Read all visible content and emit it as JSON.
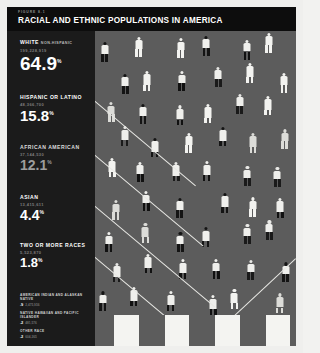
{
  "header": {
    "figure_number": "FIGURE 8.1",
    "title": "RACIAL AND ETHNIC POPULATIONS IN AMERICA"
  },
  "groups": [
    {
      "label": "WHITE",
      "sub": "NON-HISPANIC",
      "population": "199,228,919",
      "percent": "64.9",
      "symbol": "%"
    },
    {
      "label": "HISPANIC OR LATINO",
      "sub": "",
      "population": "48,366,700",
      "percent": "15.8",
      "symbol": "%"
    },
    {
      "label": "AFRICAN AMERICAN",
      "sub": "",
      "population": "37,144,530",
      "percent": "12.1",
      "symbol": "%"
    },
    {
      "label": "ASIAN",
      "sub": "",
      "population": "13,415,611",
      "percent": "4.4",
      "symbol": "%"
    },
    {
      "label": "TWO OR MORE RACES",
      "sub": "",
      "population": "5,523,870",
      "percent": "1.8",
      "symbol": "%"
    }
  ],
  "footnotes": [
    {
      "label": "AMERICAN INDIAN AND ALASKAN NATIVE",
      "percent": ".9",
      "population": "2,475,956"
    },
    {
      "label": "NATIVE HAWAIIAN AND PACIFIC ISLANDER",
      "percent": ".2",
      "population": "481,576"
    },
    {
      "label": "OTHER RACE",
      "percent": ".2",
      "population": "604,265"
    }
  ],
  "colors": {
    "panel_background": "#1b1b1b",
    "header_background": "#0d0d0d",
    "field_background": "#5c5c5c",
    "figure_light": "#f3f3f0",
    "figure_dark": "#141414",
    "divider_line": "#e8e8e4",
    "page_background": "#efefed"
  },
  "chart_data": {
    "type": "pictogram",
    "title": "RACIAL AND ETHNIC POPULATIONS IN AMERICA",
    "subtitle": "FIGURE 8.1",
    "unit": "each figure represents a share of the U.S. population",
    "categories": [
      "White (non-Hispanic)",
      "Hispanic or Latino",
      "African American",
      "Asian",
      "Two or more races",
      "American Indian and Alaskan Native",
      "Native Hawaiian and Pacific Islander",
      "Other race"
    ],
    "values": [
      64.9,
      15.8,
      12.1,
      4.4,
      1.8,
      0.9,
      0.2,
      0.2
    ],
    "populations": [
      199228919,
      48366700,
      37144530,
      13415611,
      5523870,
      2475956,
      481576,
      604265
    ],
    "xlabel": "",
    "ylabel": "Percent of total population",
    "ylim": [
      0,
      100
    ],
    "grid": false,
    "legend": "left sidebar",
    "annotation": "Diagonal white rules partition the pictogram field into population bands."
  }
}
